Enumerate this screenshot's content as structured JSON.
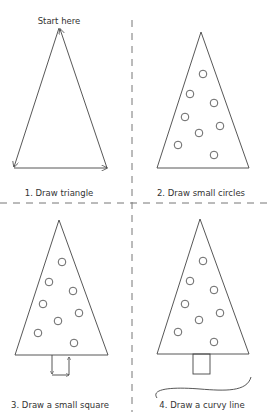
{
  "instructions": {
    "start_label": "Start here",
    "steps": [
      {
        "label": "1. Draw triangle"
      },
      {
        "label": "2. Draw small circles"
      },
      {
        "label": "3. Draw a small square"
      },
      {
        "label": "4. Draw a curvy line"
      }
    ]
  },
  "colors": {
    "line": "#444444",
    "divider": "#777777",
    "text": "#333333",
    "background": "#ffffff"
  }
}
